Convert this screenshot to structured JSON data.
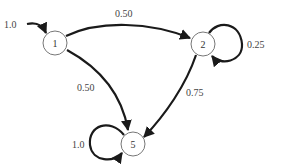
{
  "diagram": {
    "type": "markov-chain",
    "nodes": [
      {
        "id": "1",
        "label": "1",
        "cx": 55,
        "cy": 43
      },
      {
        "id": "2",
        "label": "2",
        "cx": 203,
        "cy": 44
      },
      {
        "id": "5",
        "label": "5",
        "cx": 133,
        "cy": 144
      }
    ],
    "edges": [
      {
        "from": "start",
        "to": "1",
        "label": "1.0"
      },
      {
        "from": "1",
        "to": "2",
        "label": "0.50"
      },
      {
        "from": "1",
        "to": "5",
        "label": "0.50"
      },
      {
        "from": "2",
        "to": "2",
        "label": "0.25"
      },
      {
        "from": "2",
        "to": "5",
        "label": "0.75"
      },
      {
        "from": "5",
        "to": "5",
        "label": "1.0"
      }
    ]
  }
}
